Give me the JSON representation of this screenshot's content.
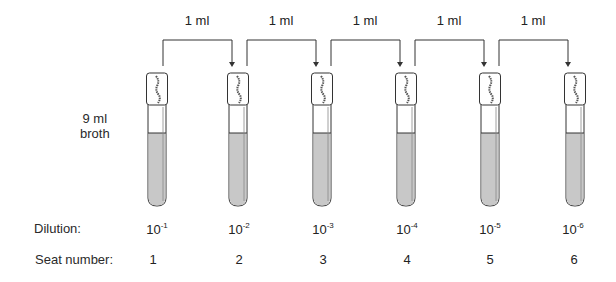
{
  "diagram": {
    "broth_label": [
      "9 ml",
      "broth"
    ],
    "row_labels": {
      "dilution": "Dilution:",
      "seat": "Seat number:"
    },
    "transfers": [
      {
        "label": "1 ml",
        "from": 1,
        "to": 2
      },
      {
        "label": "1 ml",
        "from": 2,
        "to": 3
      },
      {
        "label": "1 ml",
        "from": 3,
        "to": 4
      },
      {
        "label": "1 ml",
        "from": 4,
        "to": 5
      },
      {
        "label": "1 ml",
        "from": 5,
        "to": 6
      }
    ],
    "tubes": [
      {
        "seat": "1",
        "dilution_base": "10",
        "dilution_exp": "-1"
      },
      {
        "seat": "2",
        "dilution_base": "10",
        "dilution_exp": "-2"
      },
      {
        "seat": "3",
        "dilution_base": "10",
        "dilution_exp": "-3"
      },
      {
        "seat": "4",
        "dilution_base": "10",
        "dilution_exp": "-4"
      },
      {
        "seat": "5",
        "dilution_base": "10",
        "dilution_exp": "-5"
      },
      {
        "seat": "6",
        "dilution_base": "10",
        "dilution_exp": "-6"
      }
    ],
    "colors": {
      "line": "#333333",
      "liquid": "#c8c8c8",
      "tube_fill": "#ffffff"
    }
  }
}
